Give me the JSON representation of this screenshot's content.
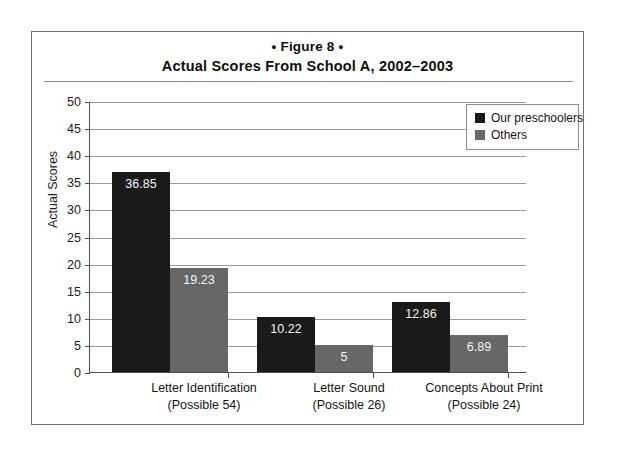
{
  "figure": {
    "number_label": "• Figure 8 •",
    "subtitle": "Actual Scores From School A, 2002–2003"
  },
  "legend": {
    "position": "top-right",
    "entries": [
      {
        "label": "Our preschoolers",
        "color": "#1a1a1a"
      },
      {
        "label": "Others",
        "color": "#676767"
      }
    ]
  },
  "axis": {
    "y_title": "Actual Scores",
    "y_ticks": [
      "0",
      "5",
      "10",
      "15",
      "20",
      "25",
      "30",
      "35",
      "40",
      "45",
      "50"
    ]
  },
  "categories": [
    {
      "name": "Letter Identification",
      "possible": "(Possible 54)"
    },
    {
      "name": "Letter Sound",
      "possible": "(Possible 26)"
    },
    {
      "name": "Concepts About Print",
      "possible": "(Possible 24)"
    }
  ],
  "bar_labels": {
    "g0s0": "36.85",
    "g0s1": "19.23",
    "g1s0": "10.22",
    "g1s1": "5",
    "g2s0": "12.86",
    "g2s1": "6.89"
  },
  "chart_data": {
    "type": "bar",
    "title": "Actual Scores From School A, 2002–2003",
    "subtitle": "• Figure 8 •",
    "xlabel": "",
    "ylabel": "Actual Scores",
    "ylim": [
      0,
      50
    ],
    "ytick_step": 5,
    "yticks": [
      0,
      5,
      10,
      15,
      20,
      25,
      30,
      35,
      40,
      45,
      50
    ],
    "grid": "horizontal",
    "legend_position": "top-right",
    "categories": [
      "Letter Identification (Possible 54)",
      "Letter Sound (Possible 26)",
      "Concepts About Print (Possible 24)"
    ],
    "category_possible_scores": [
      54,
      26,
      24
    ],
    "series": [
      {
        "name": "Our preschoolers",
        "color": "#1a1a1a",
        "values": [
          36.85,
          10.22,
          12.86
        ]
      },
      {
        "name": "Others",
        "color": "#676767",
        "values": [
          19.23,
          5,
          6.89
        ]
      }
    ]
  }
}
